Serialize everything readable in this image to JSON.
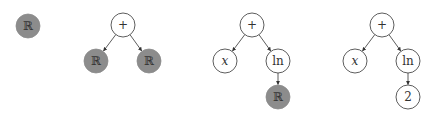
{
  "colors": {
    "filled_node": "#8c8c8c",
    "empty_node": "#ffffff",
    "stroke": "#333333",
    "edge": "#333333",
    "text": "#333333"
  },
  "trees": [
    {
      "name": "tree-1",
      "nodes": [
        {
          "id": "t1n1",
          "label": "ℝ",
          "x": 28,
          "y": 26,
          "filled": true,
          "italic": false
        }
      ],
      "edges": []
    },
    {
      "name": "tree-2",
      "nodes": [
        {
          "id": "t2n1",
          "label": "+",
          "x": 123,
          "y": 25,
          "filled": false,
          "italic": false
        },
        {
          "id": "t2n2",
          "label": "ℝ",
          "x": 96,
          "y": 61,
          "filled": true,
          "italic": false
        },
        {
          "id": "t2n3",
          "label": "ℝ",
          "x": 149,
          "y": 61,
          "filled": true,
          "italic": false
        }
      ],
      "edges": [
        [
          "t2n1",
          "t2n2"
        ],
        [
          "t2n1",
          "t2n3"
        ]
      ]
    },
    {
      "name": "tree-3",
      "nodes": [
        {
          "id": "t3n1",
          "label": "+",
          "x": 252,
          "y": 25,
          "filled": false,
          "italic": false
        },
        {
          "id": "t3n2",
          "label": "x",
          "x": 225,
          "y": 61,
          "filled": false,
          "italic": true
        },
        {
          "id": "t3n3",
          "label": "ln",
          "x": 278,
          "y": 61,
          "filled": false,
          "italic": false
        },
        {
          "id": "t3n4",
          "label": "ℝ",
          "x": 278,
          "y": 97,
          "filled": true,
          "italic": false
        }
      ],
      "edges": [
        [
          "t3n1",
          "t3n2"
        ],
        [
          "t3n1",
          "t3n3"
        ],
        [
          "t3n3",
          "t3n4"
        ]
      ]
    },
    {
      "name": "tree-4",
      "nodes": [
        {
          "id": "t4n1",
          "label": "+",
          "x": 382,
          "y": 25,
          "filled": false,
          "italic": false
        },
        {
          "id": "t4n2",
          "label": "x",
          "x": 355,
          "y": 61,
          "filled": false,
          "italic": true
        },
        {
          "id": "t4n3",
          "label": "ln",
          "x": 408,
          "y": 61,
          "filled": false,
          "italic": false
        },
        {
          "id": "t4n4",
          "label": "2",
          "x": 408,
          "y": 97,
          "filled": false,
          "italic": false
        }
      ],
      "edges": [
        [
          "t4n1",
          "t4n2"
        ],
        [
          "t4n1",
          "t4n3"
        ],
        [
          "t4n3",
          "t4n4"
        ]
      ]
    }
  ],
  "node_radius": 12
}
